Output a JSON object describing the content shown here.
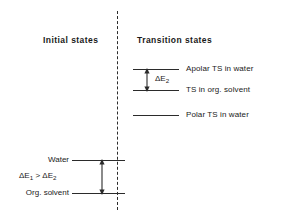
{
  "diagram": {
    "type": "energy-level-diagram",
    "line_color": "#2b2b2b",
    "background": "#ffffff",
    "divider": {
      "style": "dashed",
      "orientation": "vertical"
    },
    "sections": {
      "initial": {
        "heading": "Initial  states",
        "levels": [
          {
            "id": "water",
            "label": "Water",
            "relative_energy": "higher"
          },
          {
            "id": "org-solvent",
            "label": "Org. solvent",
            "relative_energy": "lower"
          }
        ],
        "gap_annotation": {
          "delta_symbol": "ΔE",
          "delta_subscript": "1",
          "comparator": ">",
          "compared_symbol": "ΔE",
          "compared_subscript": "2",
          "full_text": "ΔE1 > ΔE2",
          "arrow": "double-headed-vertical"
        }
      },
      "transition": {
        "heading": "Transition  states",
        "levels": [
          {
            "id": "apolar-ts-water",
            "label": "Apolar TS in water",
            "relative_energy": "highest"
          },
          {
            "id": "ts-org-solvent",
            "label": "TS in org. solvent",
            "relative_energy": "middle"
          },
          {
            "id": "polar-ts-water",
            "label": "Polar TS in water",
            "relative_energy": "lowest"
          }
        ],
        "gap_annotation": {
          "delta_symbol": "ΔE",
          "delta_subscript": "2",
          "full_text": "ΔE2",
          "arrow": "double-headed-vertical",
          "between": [
            "apolar-ts-water",
            "ts-org-solvent"
          ]
        }
      }
    }
  }
}
